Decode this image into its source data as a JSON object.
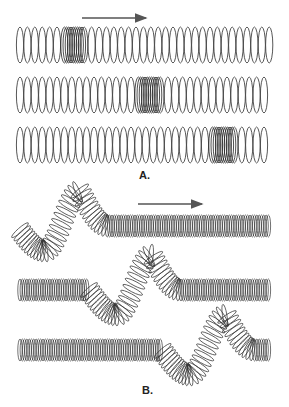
{
  "figure": {
    "panel_a": {
      "label": "A.",
      "description": "Longitudinal wave in a spring (slinky): compression pulse travelling right",
      "arrow_direction": "right",
      "rows": [
        {
          "compression_start_x": 58,
          "compression_end_x": 84
        },
        {
          "compression_start_x": 134,
          "compression_end_x": 160
        },
        {
          "compression_start_x": 208,
          "compression_end_x": 234
        }
      ]
    },
    "panel_b": {
      "label": "B.",
      "description": "Transverse wave in a spring: pulse travelling right",
      "arrow_direction": "right",
      "rows": [
        {
          "pulse_trough_x": 45,
          "pulse_peak_x": 80
        },
        {
          "pulse_trough_x": 117,
          "pulse_peak_x": 152
        },
        {
          "pulse_trough_x": 190,
          "pulse_peak_x": 226
        }
      ]
    },
    "colors": {
      "ink": "#333333",
      "arrow": "#555555",
      "compression": "#222222",
      "background": "#ffffff"
    }
  }
}
